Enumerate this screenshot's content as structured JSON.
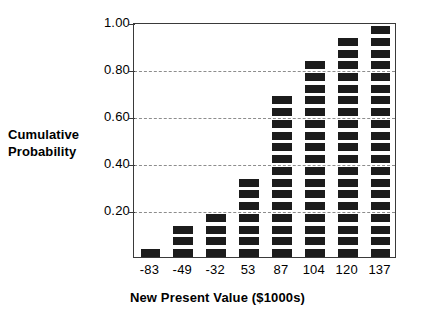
{
  "chart_data": {
    "type": "bar",
    "title": "",
    "subtitle": "",
    "xlabel": "New Present Value ($1000s)",
    "ylabel": "Cumulative Probability",
    "ylabel_lines": [
      "Cumulative",
      "Probability"
    ],
    "categories": [
      "-83",
      "-49",
      "-32",
      "53",
      "87",
      "104",
      "120",
      "137"
    ],
    "values": [
      0.05,
      0.14,
      0.2,
      0.33,
      0.66,
      0.83,
      0.94,
      1.0
    ],
    "segment_counts": [
      1,
      3,
      4,
      7,
      14,
      17,
      19,
      20
    ],
    "ylim": [
      0.0,
      1.0
    ],
    "yticks": [
      "0.20",
      "0.40",
      "0.60",
      "0.80",
      "1.00"
    ],
    "ytick_values": [
      0.2,
      0.4,
      0.6,
      0.8,
      1.0
    ],
    "gridlines": [
      0.2,
      0.4,
      0.6,
      0.8
    ],
    "grid": true,
    "grid_style": "dashed",
    "legend": "none",
    "bar_color": "#1c1c1c",
    "grid_color": "#8d8d8d",
    "axis_color": "#3a3a3a",
    "background_color": "#ffffff"
  }
}
